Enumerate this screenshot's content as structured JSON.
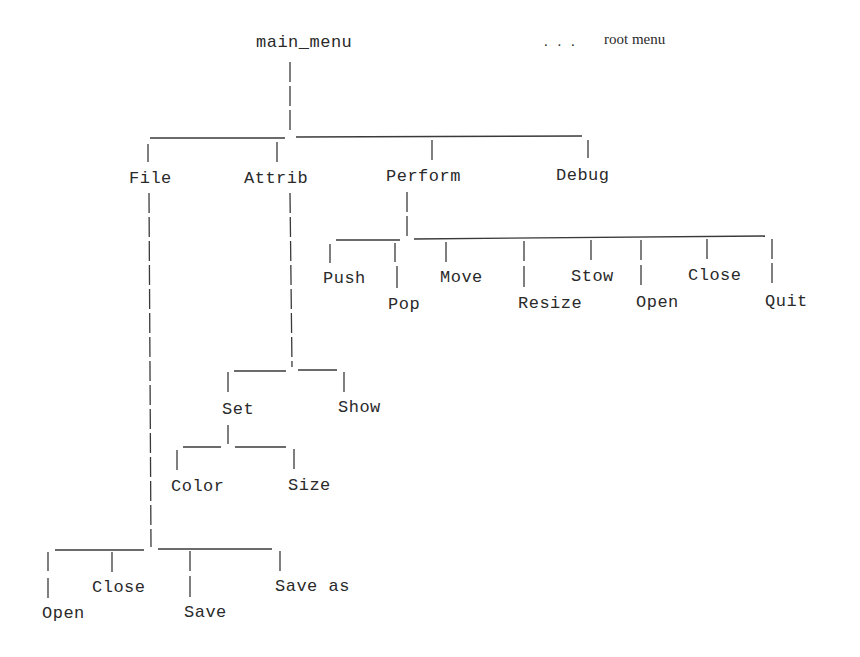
{
  "diagram": {
    "type": "menu-tree",
    "annotation": {
      "dots": ". . .",
      "label": "root menu"
    },
    "root": {
      "label": "main_menu",
      "children": [
        {
          "label": "File",
          "children": [
            {
              "label": "Open"
            },
            {
              "label": "Close"
            },
            {
              "label": "Save"
            },
            {
              "label": "Save as"
            }
          ]
        },
        {
          "label": "Attrib",
          "children": [
            {
              "label": "Set",
              "children": [
                {
                  "label": "Color"
                },
                {
                  "label": "Size"
                }
              ]
            },
            {
              "label": "Show"
            }
          ]
        },
        {
          "label": "Perform",
          "children": [
            {
              "label": "Push"
            },
            {
              "label": "Pop"
            },
            {
              "label": "Move"
            },
            {
              "label": "Resize"
            },
            {
              "label": "Stow"
            },
            {
              "label": "Open"
            },
            {
              "label": "Close"
            },
            {
              "label": "Quit"
            }
          ]
        },
        {
          "label": "Debug"
        }
      ]
    }
  },
  "colors": {
    "ink": "#2a2a2a",
    "background": "#ffffff"
  }
}
